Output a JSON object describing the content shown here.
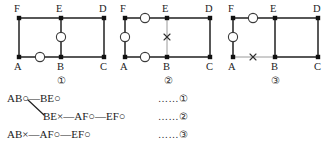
{
  "figure": {
    "vertex_labels": [
      "F",
      "E",
      "D",
      "A",
      "B",
      "C"
    ],
    "graphs": [
      {
        "caption": "①",
        "name": "graph-1",
        "vertices": [
          {
            "id": "F",
            "label": "F",
            "pos": "top-left"
          },
          {
            "id": "E",
            "label": "E",
            "pos": "top-mid"
          },
          {
            "id": "D",
            "label": "D",
            "pos": "top-right"
          },
          {
            "id": "A",
            "label": "A",
            "pos": "bottom-left"
          },
          {
            "id": "B",
            "label": "B",
            "pos": "bottom-mid"
          },
          {
            "id": "C",
            "label": "C",
            "pos": "bottom-right"
          }
        ],
        "edges": [
          {
            "from": "F",
            "to": "E",
            "state": "solid",
            "marker": "none"
          },
          {
            "from": "E",
            "to": "D",
            "state": "solid",
            "marker": "none"
          },
          {
            "from": "F",
            "to": "A",
            "state": "solid",
            "marker": "none"
          },
          {
            "from": "D",
            "to": "C",
            "state": "solid",
            "marker": "none"
          },
          {
            "from": "A",
            "to": "B",
            "state": "solid",
            "marker": "circle"
          },
          {
            "from": "B",
            "to": "C",
            "state": "solid",
            "marker": "none"
          },
          {
            "from": "E",
            "to": "B",
            "state": "solid",
            "marker": "circle"
          }
        ]
      },
      {
        "caption": "②",
        "name": "graph-2",
        "vertices": [
          {
            "id": "F",
            "label": "F",
            "pos": "top-left"
          },
          {
            "id": "E",
            "label": "E",
            "pos": "top-mid"
          },
          {
            "id": "D",
            "label": "D",
            "pos": "top-right"
          },
          {
            "id": "A",
            "label": "A",
            "pos": "bottom-left"
          },
          {
            "id": "B",
            "label": "B",
            "pos": "bottom-mid"
          },
          {
            "id": "C",
            "label": "C",
            "pos": "bottom-right"
          }
        ],
        "edges": [
          {
            "from": "F",
            "to": "E",
            "state": "solid",
            "marker": "circle"
          },
          {
            "from": "E",
            "to": "D",
            "state": "solid",
            "marker": "none"
          },
          {
            "from": "F",
            "to": "A",
            "state": "solid",
            "marker": "circle"
          },
          {
            "from": "D",
            "to": "C",
            "state": "solid",
            "marker": "none"
          },
          {
            "from": "A",
            "to": "B",
            "state": "solid",
            "marker": "circle"
          },
          {
            "from": "B",
            "to": "C",
            "state": "solid",
            "marker": "none"
          },
          {
            "from": "E",
            "to": "B",
            "state": "faded",
            "marker": "cross"
          }
        ]
      },
      {
        "caption": "③",
        "name": "graph-3",
        "vertices": [
          {
            "id": "F",
            "label": "F",
            "pos": "top-left"
          },
          {
            "id": "E",
            "label": "E",
            "pos": "top-mid"
          },
          {
            "id": "D",
            "label": "D",
            "pos": "top-right"
          },
          {
            "id": "A",
            "label": "A",
            "pos": "bottom-left"
          },
          {
            "id": "B",
            "label": "B",
            "pos": "bottom-mid"
          },
          {
            "id": "C",
            "label": "C",
            "pos": "bottom-right"
          }
        ],
        "edges": [
          {
            "from": "F",
            "to": "E",
            "state": "solid",
            "marker": "circle"
          },
          {
            "from": "E",
            "to": "D",
            "state": "solid",
            "marker": "none"
          },
          {
            "from": "F",
            "to": "A",
            "state": "solid",
            "marker": "circle"
          },
          {
            "from": "D",
            "to": "C",
            "state": "solid",
            "marker": "none"
          },
          {
            "from": "A",
            "to": "B",
            "state": "faded",
            "marker": "cross"
          },
          {
            "from": "B",
            "to": "C",
            "state": "solid",
            "marker": "none"
          },
          {
            "from": "E",
            "to": "B",
            "state": "solid",
            "marker": "none"
          }
        ]
      }
    ]
  },
  "derivation": {
    "rows": [
      {
        "id": "row-1",
        "terms": [
          "AB○",
          "—",
          "BE○"
        ],
        "text": "AB○—BE○",
        "ref": "……①"
      },
      {
        "id": "row-2",
        "terms": [
          "BE×",
          "—",
          "AF○",
          "—",
          "EF○"
        ],
        "text": "BE×—AF○—EF○",
        "ref": "……②"
      },
      {
        "id": "row-3",
        "terms": [
          "AB×",
          "—",
          "AF○",
          "—",
          "EF○"
        ],
        "text": "AB×—AF○—EF○",
        "ref": "……③"
      }
    ],
    "branch_connector": "diagonal from AB○ down to BE×"
  },
  "colors": {
    "line": "#202020",
    "faded_line": "#9a9a9a",
    "vertex": "#111111",
    "marker_stroke": "#303030",
    "text": "#1c1c1c"
  }
}
